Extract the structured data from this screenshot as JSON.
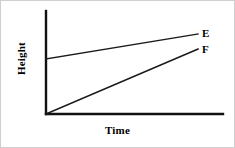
{
  "figure": {
    "background_color": "#ffffff",
    "stroke_color": "#111111",
    "border_color": "#cfcfcf"
  },
  "chart_data": {
    "type": "line",
    "title": "",
    "subtitle": "",
    "xlabel": "Time",
    "ylabel": "Height",
    "xlim": [
      0,
      100
    ],
    "ylim": [
      0,
      100
    ],
    "grid": false,
    "xticks": [],
    "yticks": [],
    "xticklabels": [],
    "yticklabels": [],
    "legend": "inline-end-labels",
    "series": [
      {
        "name": "E",
        "label": "E",
        "color": "#1a1a1a",
        "x": [
          0,
          100
        ],
        "y": [
          53,
          78
        ],
        "description": "Starts at a positive height above the origin and rises slowly with a shallow positive slope."
      },
      {
        "name": "F",
        "label": "F",
        "color": "#1a1a1a",
        "x": [
          0,
          100
        ],
        "y": [
          0,
          63
        ],
        "description": "Starts at the origin with zero height and rises steeply with a steeper positive slope, staying below line E."
      }
    ],
    "annotations": [
      {
        "text": "E",
        "x": 103,
        "y": 78
      },
      {
        "text": "F",
        "x": 103,
        "y": 63
      }
    ]
  },
  "labels": {
    "y_axis_title": "Height",
    "x_axis_title": "Time",
    "series_e": "E",
    "series_f": "F"
  },
  "geometry": {
    "y_axis": {
      "x1": 45,
      "y1": 10,
      "x2": 45,
      "y2": 113
    },
    "x_axis": {
      "x1": 45,
      "y1": 113,
      "x2": 222,
      "y2": 113
    },
    "line_e": {
      "x1": 45,
      "y1": 58,
      "x2": 197,
      "y2": 33
    },
    "line_f": {
      "x1": 45,
      "y1": 113,
      "x2": 197,
      "y2": 48
    }
  }
}
